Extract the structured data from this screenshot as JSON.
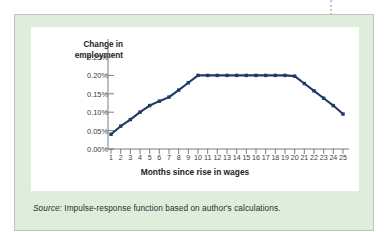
{
  "panel": {
    "background_color": "#dfeddc",
    "border_color": "#b9c8b6"
  },
  "source": {
    "label": "Source:",
    "text": " Impulse-response function based on author's calculations."
  },
  "chart_data": {
    "type": "line",
    "title": "",
    "ylabel": "Change in\nemployment",
    "ylabel_line1": "Change in",
    "ylabel_line2": "employment",
    "xlabel": "Months since rise in wages",
    "series_color": "#1f3a66",
    "marker": "square",
    "grid": false,
    "legend": "none",
    "ylim": [
      0.0,
      0.275
    ],
    "xlim": [
      1,
      25
    ],
    "ytick_values": [
      0.0,
      0.05,
      0.1,
      0.15,
      0.2,
      0.25
    ],
    "ytick_labels": [
      "0.00%",
      "0.05%",
      "0.10%",
      "0.15%",
      "0.20%",
      "0.25%"
    ],
    "categories": [
      1,
      2,
      3,
      4,
      5,
      6,
      7,
      8,
      9,
      10,
      11,
      12,
      13,
      14,
      15,
      16,
      17,
      18,
      19,
      20,
      21,
      22,
      23,
      24,
      25
    ],
    "xtick_labels": [
      "1",
      "2",
      "3",
      "4",
      "5",
      "6",
      "7",
      "8",
      "9",
      "10",
      "11",
      "12",
      "13",
      "14",
      "15",
      "16",
      "17",
      "18",
      "19",
      "20",
      "21",
      "22",
      "23",
      "24",
      "25"
    ],
    "values": [
      0.04,
      0.062,
      0.08,
      0.1,
      0.118,
      0.13,
      0.141,
      0.16,
      0.18,
      0.2,
      0.2,
      0.2,
      0.2,
      0.2,
      0.2,
      0.2,
      0.2,
      0.2,
      0.2,
      0.198,
      0.178,
      0.158,
      0.138,
      0.118,
      0.095
    ],
    "value_unit": "%"
  }
}
